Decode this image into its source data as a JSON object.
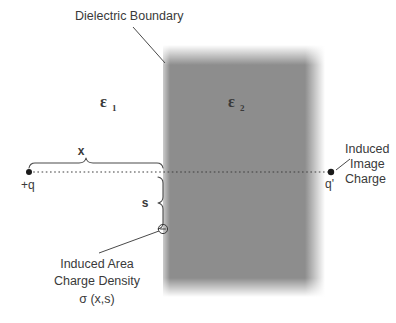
{
  "figure": {
    "title_callout": "Dielectric Boundary",
    "region_left_label": "ε",
    "region_left_subscript": "1",
    "region_right_label": "ε",
    "region_right_subscript": "2",
    "distance_x_label": "x",
    "distance_s_label": "s",
    "source_charge_label": "+q",
    "image_charge_label": "q'",
    "image_charge_callout_line1": "Induced",
    "image_charge_callout_line2": "Image",
    "image_charge_callout_line3": "Charge",
    "sigma_callout_line1": "Induced Area",
    "sigma_callout_line2": "Charge Density",
    "sigma_callout_line3": "σ (x,s)",
    "induced_charge_symbol": "−"
  },
  "colors": {
    "background": "#ffffff",
    "dielectric_fill": "#8d8d8d",
    "text": "#3a3a3a",
    "line": "#4a4a4a",
    "dot": "#1a1a1a"
  }
}
